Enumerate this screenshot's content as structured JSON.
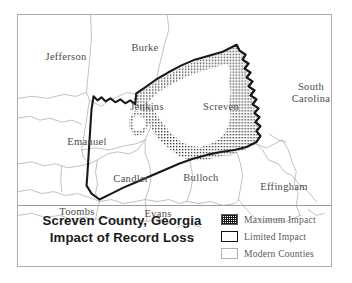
{
  "figure": {
    "name": "screven-county-georgia-record-loss-map",
    "background_color": "#ffffff",
    "frame_color": "#adadad"
  },
  "title": {
    "line1": "Screven County, Georgia",
    "line2": "Impact of Record Loss"
  },
  "legend": {
    "items": [
      {
        "label": "Maximum Impact",
        "swatch": "stipple-pattern-swatch",
        "pattern": "stipple",
        "color": "#1a1a1a"
      },
      {
        "label": "Limited Impact",
        "swatch": "thick-outline-swatch",
        "pattern": "thick-border",
        "color": "#111111"
      },
      {
        "label": "Modern Counties",
        "swatch": "thin-outline-swatch",
        "pattern": "thin-border",
        "color": "#b0b0b0"
      }
    ]
  },
  "map": {
    "label_color": "#4a4a4a",
    "county_line_color": "#b4b4b4",
    "limited_impact_line_color": "#1a1a1a",
    "maximum_impact_fill": "stipple",
    "labels": [
      {
        "name": "jefferson",
        "text": "Jefferson",
        "x": 48,
        "y": 42
      },
      {
        "name": "burke",
        "text": "Burke",
        "x": 127,
        "y": 33
      },
      {
        "name": "jenkins",
        "text": "Jenkins",
        "x": 129,
        "y": 92
      },
      {
        "name": "screven",
        "text": "Screven",
        "x": 203,
        "y": 92
      },
      {
        "name": "south-carolina-line1",
        "text": "South",
        "x": 293,
        "y": 72
      },
      {
        "name": "south-carolina-line2",
        "text": "Carolina",
        "x": 293,
        "y": 84
      },
      {
        "name": "emanuel",
        "text": "Emanuel",
        "x": 69,
        "y": 127
      },
      {
        "name": "candler",
        "text": "Candler",
        "x": 113,
        "y": 164
      },
      {
        "name": "bulloch",
        "text": "Bulloch",
        "x": 183,
        "y": 163
      },
      {
        "name": "effingham",
        "text": "Effingham",
        "x": 266,
        "y": 172
      },
      {
        "name": "toombs",
        "text": "Toombs",
        "x": 59,
        "y": 197
      },
      {
        "name": "evans",
        "text": "Evans",
        "x": 140,
        "y": 199
      }
    ]
  }
}
